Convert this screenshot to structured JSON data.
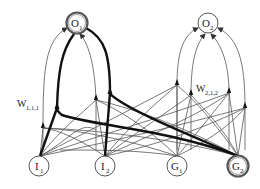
{
  "diagram": {
    "type": "neural-network-graph",
    "nodes": {
      "O1": {
        "base": "O",
        "sub": "1",
        "highlighted": true
      },
      "O2": {
        "base": "O",
        "sub": "2",
        "highlighted": false
      },
      "I1": {
        "base": "I",
        "sub": "1",
        "highlighted": false
      },
      "I2": {
        "base": "I",
        "sub": "2",
        "highlighted": false
      },
      "G1": {
        "base": "G",
        "sub": "1",
        "highlighted": false
      },
      "G2": {
        "base": "G",
        "sub": "2",
        "highlighted": true
      }
    },
    "weight_labels": {
      "w111": {
        "base": "W",
        "sub": "1,1,1"
      },
      "w212": {
        "base": "W",
        "sub": "2,1,2"
      }
    },
    "thick_paths": [
      "I1->O1",
      "I2->O1",
      "G2->O1 (via col 2)",
      "G2->O1 (via col 4)"
    ],
    "colors": {
      "thick_edge": "#111111",
      "thin_edge": "#555555",
      "node_stroke": "#444444"
    }
  }
}
